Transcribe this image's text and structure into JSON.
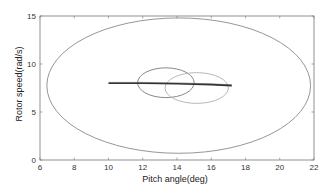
{
  "chart_data": {
    "type": "line",
    "title": "",
    "xlabel": "Pitch angle(deg)",
    "ylabel": "Rotor speed(rad/s)",
    "xlim": [
      6,
      22
    ],
    "ylim": [
      0,
      15
    ],
    "xticks": [
      6,
      8,
      10,
      12,
      14,
      16,
      18,
      20,
      22
    ],
    "yticks": [
      0,
      5,
      10,
      15
    ],
    "grid": false,
    "legend": null,
    "series": [
      {
        "name": "large-ellipse",
        "shape": "ellipse",
        "center": [
          14.1,
          7.75
        ],
        "radius_x": 7.7,
        "radius_y": 7.05,
        "color": "#8a8a8a"
      },
      {
        "name": "small-ellipse-1",
        "shape": "ellipse",
        "center": [
          13.35,
          8.05
        ],
        "radius_x": 1.65,
        "radius_y": 1.55,
        "color": "#7a7a7a"
      },
      {
        "name": "small-ellipse-2",
        "shape": "ellipse",
        "center": [
          15.15,
          7.5
        ],
        "radius_x": 1.85,
        "radius_y": 1.6,
        "color": "#b0b0b0"
      },
      {
        "name": "trajectory",
        "shape": "polyline",
        "x": [
          10.0,
          12.0,
          14.0,
          16.0,
          17.2
        ],
        "y": [
          8.0,
          8.0,
          7.95,
          7.85,
          7.75
        ],
        "color": "#333333"
      }
    ]
  },
  "axes": {
    "box_px": {
      "left": 40,
      "top": 16,
      "right": 314,
      "bottom": 160
    }
  }
}
